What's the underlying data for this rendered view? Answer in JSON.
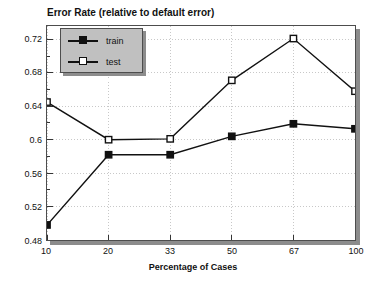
{
  "chart_data": {
    "type": "line",
    "title": "Error Rate (relative to default error)",
    "xlabel": "Percentage of Cases",
    "ylabel": "",
    "categories": [
      "10",
      "20",
      "33",
      "50",
      "67",
      "100"
    ],
    "x": [
      10,
      20,
      33,
      50,
      67,
      100
    ],
    "series": [
      {
        "name": "train",
        "marker": "filled-square",
        "color": "#111111",
        "values": [
          0.498,
          0.582,
          0.582,
          0.604,
          0.619,
          0.613
        ]
      },
      {
        "name": "test",
        "marker": "open-square",
        "color": "#111111",
        "values": [
          0.645,
          0.6,
          0.601,
          0.671,
          0.721,
          0.658
        ]
      }
    ],
    "ylim": [
      0.48,
      0.736
    ],
    "yticks": [
      0.48,
      0.52,
      0.56,
      0.6,
      0.64,
      0.68,
      0.72
    ],
    "ytick_labels": [
      "0.48",
      "0.52",
      "0.56",
      "0.6",
      "0.64",
      "0.68",
      "0.72"
    ],
    "xtick_labels": [
      "10",
      "20",
      "33",
      "50",
      "67",
      "100"
    ],
    "grid": true,
    "grid_color": "#c8c8c8",
    "legend_position": "top-left",
    "legend_entries": [
      "train",
      "test"
    ]
  },
  "legend": {
    "entries": [
      {
        "label": "train"
      },
      {
        "label": "test"
      }
    ]
  }
}
